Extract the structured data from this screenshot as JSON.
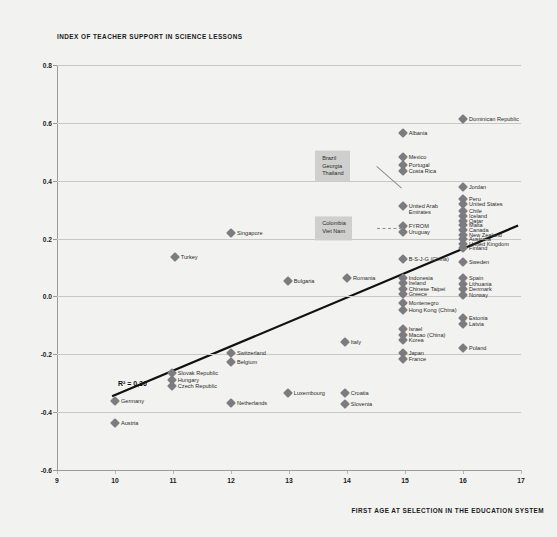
{
  "chart_data": {
    "type": "scatter",
    "title": "INDEX OF TEACHER SUPPORT IN SCIENCE LESSONS",
    "xlabel": "FIRST AGE AT SELECTION IN THE EDUCATION SYSTEM",
    "ylabel": "INDEX OF TEACHER SUPPORT IN SCIENCE LESSONS",
    "xlim": [
      9,
      17
    ],
    "ylim": [
      -0.6,
      0.8
    ],
    "xticks": [
      "9",
      "10",
      "11",
      "12",
      "13",
      "14",
      "15",
      "16",
      "17"
    ],
    "yticks": [
      "0.8",
      "0.6",
      "0.4",
      "0.2",
      "0.0",
      "-0.2",
      "-0.4",
      "-0.6"
    ],
    "grid": true,
    "legend": "none",
    "annotations": [
      {
        "text": "R² = 0,36",
        "x": 10.05,
        "y": -0.29
      }
    ],
    "trendline": {
      "x1": 9.95,
      "y1": -0.345,
      "x2": 16.95,
      "y2": 0.245
    },
    "callouts": [
      {
        "names": [
          "Brazil",
          "Georgia",
          "Thailand"
        ],
        "x": 14.52,
        "y": 0.45,
        "target_x": 14.95,
        "target_y": 0.375,
        "style": "solid"
      },
      {
        "names": [
          "Colombia",
          "Viet Nam"
        ],
        "x": 14.52,
        "y": 0.235,
        "target_x": 14.95,
        "target_y": 0.235,
        "style": "dashed"
      }
    ],
    "points": [
      {
        "label": "Dominican Republic",
        "x": 16.0,
        "y": 0.615,
        "label_pos": "right"
      },
      {
        "label": "Albania",
        "x": 14.96,
        "y": 0.565,
        "label_pos": "right"
      },
      {
        "label": "Mexico",
        "x": 14.96,
        "y": 0.482,
        "label_pos": "right"
      },
      {
        "label": "Portugal",
        "x": 14.96,
        "y": 0.455,
        "label_pos": "right"
      },
      {
        "label": "Costa Rica",
        "x": 14.96,
        "y": 0.432,
        "label_pos": "right"
      },
      {
        "label": "Jordan",
        "x": 16.0,
        "y": 0.378,
        "label_pos": "right"
      },
      {
        "label": "Peru",
        "x": 16.0,
        "y": 0.338,
        "label_pos": "right"
      },
      {
        "label": "United States",
        "x": 16.0,
        "y": 0.318,
        "label_pos": "right"
      },
      {
        "label": "Chile",
        "x": 16.0,
        "y": 0.295,
        "label_pos": "right"
      },
      {
        "label": "Iceland",
        "x": 16.0,
        "y": 0.278,
        "label_pos": "right"
      },
      {
        "label": "Qatar",
        "x": 16.0,
        "y": 0.262,
        "label_pos": "right"
      },
      {
        "label": "Malta",
        "x": 16.0,
        "y": 0.246,
        "label_pos": "right"
      },
      {
        "label": "Canada",
        "x": 16.0,
        "y": 0.23,
        "label_pos": "right"
      },
      {
        "label": "New Zealand",
        "x": 16.0,
        "y": 0.214,
        "label_pos": "right"
      },
      {
        "label": "Australia",
        "x": 16.0,
        "y": 0.198,
        "label_pos": "right"
      },
      {
        "label": "United Kingdom",
        "x": 16.0,
        "y": 0.182,
        "label_pos": "right"
      },
      {
        "label": "Finland",
        "x": 16.0,
        "y": 0.166,
        "label_pos": "right"
      },
      {
        "label": "Sweden",
        "x": 16.0,
        "y": 0.118,
        "label_pos": "right"
      },
      {
        "label": "Spain",
        "x": 16.0,
        "y": 0.062,
        "label_pos": "right"
      },
      {
        "label": "Lithuania",
        "x": 16.0,
        "y": 0.042,
        "label_pos": "right"
      },
      {
        "label": "Denmark",
        "x": 16.0,
        "y": 0.024,
        "label_pos": "right"
      },
      {
        "label": "Norway",
        "x": 16.0,
        "y": 0.006,
        "label_pos": "right"
      },
      {
        "label": "Estonia",
        "x": 16.0,
        "y": -0.075,
        "label_pos": "right"
      },
      {
        "label": "Latvia",
        "x": 16.0,
        "y": -0.095,
        "label_pos": "right"
      },
      {
        "label": "Poland",
        "x": 16.0,
        "y": -0.178,
        "label_pos": "right"
      },
      {
        "label": "United Arab",
        "x": 14.96,
        "y": 0.312,
        "label_pos": "right"
      },
      {
        "label": "Emirates",
        "x": 14.96,
        "y": 0.312,
        "label_pos": "hidden"
      },
      {
        "label": "FYROM",
        "x": 14.96,
        "y": 0.242,
        "label_pos": "right"
      },
      {
        "label": "Uruguay",
        "x": 14.96,
        "y": 0.222,
        "label_pos": "right"
      },
      {
        "label": "B-S-J-G (China)",
        "x": 14.96,
        "y": 0.128,
        "label_pos": "right"
      },
      {
        "label": "Indonesia",
        "x": 14.96,
        "y": 0.065,
        "label_pos": "right"
      },
      {
        "label": "Ireland",
        "x": 14.96,
        "y": 0.046,
        "label_pos": "right"
      },
      {
        "label": "Chinese Taipei",
        "x": 14.96,
        "y": 0.026,
        "label_pos": "right"
      },
      {
        "label": "Greece",
        "x": 14.96,
        "y": 0.008,
        "label_pos": "right"
      },
      {
        "label": "Montenegro",
        "x": 14.96,
        "y": -0.022,
        "label_pos": "right"
      },
      {
        "label": "Hong Kong (China)",
        "x": 14.96,
        "y": -0.046,
        "label_pos": "right"
      },
      {
        "label": "Israel",
        "x": 14.96,
        "y": -0.112,
        "label_pos": "right"
      },
      {
        "label": "Macao (China)",
        "x": 14.96,
        "y": -0.132,
        "label_pos": "right"
      },
      {
        "label": "Korea",
        "x": 14.96,
        "y": -0.152,
        "label_pos": "right"
      },
      {
        "label": "Japan",
        "x": 14.96,
        "y": -0.196,
        "label_pos": "right"
      },
      {
        "label": "France",
        "x": 14.96,
        "y": -0.218,
        "label_pos": "right"
      },
      {
        "label": "Singapore",
        "x": 12.0,
        "y": 0.218,
        "label_pos": "right"
      },
      {
        "label": "Turkey",
        "x": 11.03,
        "y": 0.136,
        "label_pos": "right"
      },
      {
        "label": "Bulgaria",
        "x": 12.98,
        "y": 0.053,
        "label_pos": "right"
      },
      {
        "label": "Romania",
        "x": 14.0,
        "y": 0.065,
        "label_pos": "right"
      },
      {
        "label": "Italy",
        "x": 13.96,
        "y": -0.158,
        "label_pos": "right"
      },
      {
        "label": "Switzerland",
        "x": 12.0,
        "y": -0.196,
        "label_pos": "right"
      },
      {
        "label": "Belgium",
        "x": 12.0,
        "y": -0.228,
        "label_pos": "right"
      },
      {
        "label": "Slovak Republic",
        "x": 10.98,
        "y": -0.266,
        "label_pos": "right"
      },
      {
        "label": "Hungary",
        "x": 10.98,
        "y": -0.288,
        "label_pos": "right"
      },
      {
        "label": "Czech Republic",
        "x": 10.98,
        "y": -0.308,
        "label_pos": "right"
      },
      {
        "label": "Luxembourg",
        "x": 12.98,
        "y": -0.335,
        "label_pos": "right"
      },
      {
        "label": "Croatia",
        "x": 13.96,
        "y": -0.335,
        "label_pos": "right"
      },
      {
        "label": "Slovenia",
        "x": 13.96,
        "y": -0.372,
        "label_pos": "right"
      },
      {
        "label": "Germany",
        "x": 10.0,
        "y": -0.362,
        "label_pos": "right"
      },
      {
        "label": "Netherlands",
        "x": 12.0,
        "y": -0.368,
        "label_pos": "right"
      },
      {
        "label": "Austria",
        "x": 10.0,
        "y": -0.438,
        "label_pos": "right"
      }
    ]
  },
  "colors": {
    "background": "#f2f2f0",
    "marker": "#7b7b80",
    "grid": "#c8c8c6",
    "trendline": "#111111",
    "callout_bg": "#cfcfcd"
  }
}
